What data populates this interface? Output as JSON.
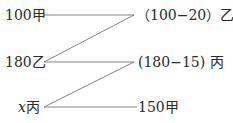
{
  "diagram": {
    "left": [
      {
        "value": "100",
        "person": "甲"
      },
      {
        "value": "180",
        "person": "乙"
      },
      {
        "value": "x",
        "person": "丙"
      }
    ],
    "right": [
      {
        "text": "（100−20）乙"
      },
      {
        "text": "(180−15) 丙"
      },
      {
        "text": "150甲"
      }
    ]
  },
  "colors": {
    "line": "#555555",
    "text": "#2a2a2a"
  }
}
